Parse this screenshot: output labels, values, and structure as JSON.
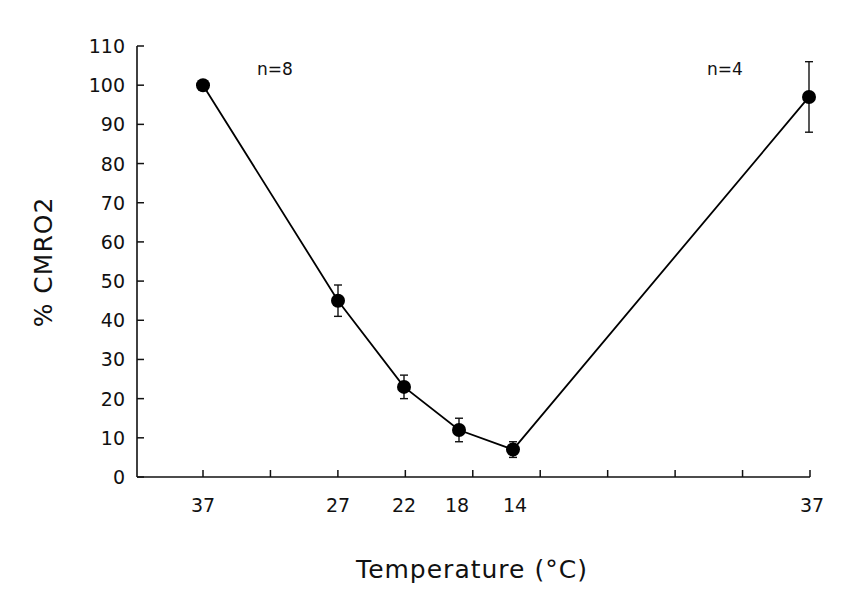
{
  "chart_data": {
    "type": "line",
    "title": "",
    "xlabel": "Temperature (°C)",
    "ylabel": "% CMRO2",
    "ylim": [
      0,
      110
    ],
    "yticks": [
      0,
      10,
      20,
      30,
      40,
      50,
      60,
      70,
      80,
      90,
      100,
      110
    ],
    "x_tick_count": 10,
    "categories": [
      "37",
      "27",
      "22",
      "18",
      "14",
      "37"
    ],
    "x_positions_px": [
      203,
      338,
      404,
      459,
      513,
      809
    ],
    "series": [
      {
        "name": "% CMRO2",
        "values": [
          100,
          45,
          23,
          12,
          7,
          97
        ],
        "error": [
          0,
          4,
          3,
          3,
          2,
          9
        ],
        "marker": "filled-circle",
        "color": "#000000"
      }
    ],
    "annotations": [
      {
        "text": "n=8",
        "position": "top-left"
      },
      {
        "text": "n=4",
        "position": "top-right"
      }
    ],
    "grid": false,
    "legend": null
  },
  "labels": {
    "x_axis_title": "Temperature (°C)",
    "y_axis_title": "% CMRO2",
    "annotation_left": "n=8",
    "annotation_right": "n=4"
  }
}
